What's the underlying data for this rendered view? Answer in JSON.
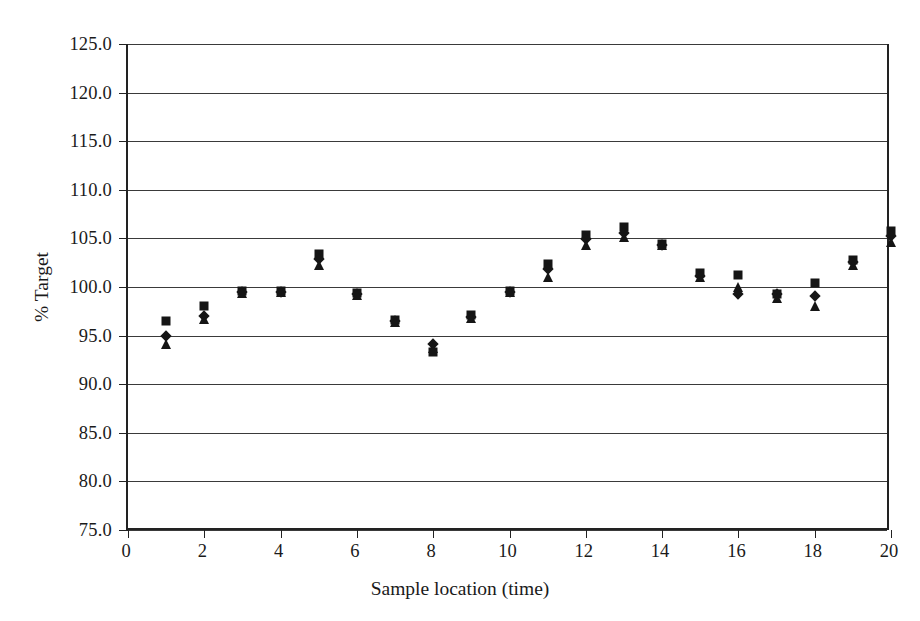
{
  "chart_data": {
    "type": "scatter",
    "title": "",
    "xlabel": "Sample location (time)",
    "ylabel": "% Target",
    "xlim": [
      0,
      20
    ],
    "ylim": [
      75.0,
      125.0
    ],
    "grid": "horizontal",
    "legend": "none",
    "xticks": [
      "0",
      "2",
      "4",
      "6",
      "8",
      "10",
      "12",
      "14",
      "16",
      "18",
      "20"
    ],
    "xtick_values": [
      0,
      2,
      4,
      6,
      8,
      10,
      12,
      14,
      16,
      18,
      20
    ],
    "yticks": [
      "75.0",
      "80.0",
      "85.0",
      "90.0",
      "95.0",
      "100.0",
      "105.0",
      "110.0",
      "115.0",
      "120.0",
      "125.0"
    ],
    "ytick_values": [
      75.0,
      80.0,
      85.0,
      90.0,
      95.0,
      100.0,
      105.0,
      110.0,
      115.0,
      120.0,
      125.0
    ],
    "x": [
      1,
      2,
      3,
      4,
      5,
      6,
      7,
      8,
      9,
      10,
      11,
      12,
      13,
      14,
      15,
      16,
      17,
      18,
      19,
      20
    ],
    "series": [
      {
        "name": "Series 1",
        "marker": "square",
        "values": [
          96.5,
          98.0,
          99.6,
          99.6,
          103.4,
          99.4,
          96.6,
          93.3,
          97.1,
          99.6,
          102.4,
          105.3,
          106.2,
          104.4,
          101.4,
          101.2,
          99.3,
          100.4,
          102.8,
          105.8
        ]
      },
      {
        "name": "Series 2",
        "marker": "diamond",
        "values": [
          95.0,
          97.0,
          99.5,
          99.5,
          102.9,
          99.3,
          96.5,
          94.1,
          96.9,
          99.5,
          101.9,
          104.9,
          105.6,
          104.3,
          101.1,
          99.3,
          99.3,
          99.1,
          102.6,
          105.2
        ]
      },
      {
        "name": "Series 3",
        "marker": "triangle",
        "values": [
          94.1,
          96.7,
          99.4,
          99.5,
          102.3,
          99.2,
          96.4,
          93.7,
          96.8,
          99.5,
          101.0,
          104.3,
          105.1,
          104.3,
          101.0,
          100.0,
          98.9,
          98.0,
          102.3,
          104.6
        ]
      }
    ]
  }
}
